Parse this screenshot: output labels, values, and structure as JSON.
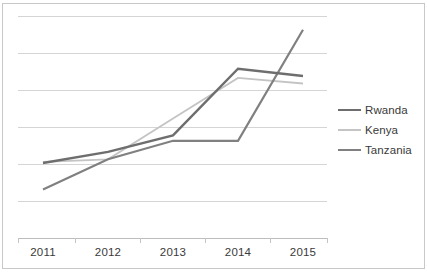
{
  "chart_data": {
    "type": "line",
    "title": "",
    "subtitle": "",
    "xlabel": "",
    "ylabel": "",
    "categories": [
      "2011",
      "2012",
      "2013",
      "2014",
      "2015"
    ],
    "x_tick_labels": [
      "2011",
      "2012",
      "2013",
      "2014",
      "2015"
    ],
    "y_tick_labels": [],
    "grid": true,
    "gridlines_count": 6,
    "legend_position": "right",
    "ylim": [
      -1,
      4
    ],
    "series": [
      {
        "name": "Rwanda",
        "color": "#6e6e6e",
        "width": 2.4,
        "values": [
          0.0,
          0.3,
          0.75,
          2.55,
          2.35
        ]
      },
      {
        "name": "Kenya",
        "color": "#c4c4c4",
        "width": 1.8,
        "values": [
          0.03,
          0.1,
          1.2,
          2.3,
          2.15
        ]
      },
      {
        "name": "Tanzania",
        "color": "#808080",
        "width": 2.2,
        "values": [
          -0.72,
          0.1,
          0.6,
          0.6,
          3.6
        ]
      }
    ]
  },
  "legend": {
    "items": [
      {
        "label": "Rwanda",
        "color": "#6e6e6e",
        "width": 2.6
      },
      {
        "label": "Kenya",
        "color": "#c4c4c4",
        "width": 2.0
      },
      {
        "label": "Tanzania",
        "color": "#808080",
        "width": 2.4
      }
    ]
  },
  "colors": {
    "gridline": "#d5d5d5",
    "axis": "#bdbdbd",
    "frame": "#c8c8c8",
    "text": "#3a3a3a",
    "background": "#ffffff"
  }
}
